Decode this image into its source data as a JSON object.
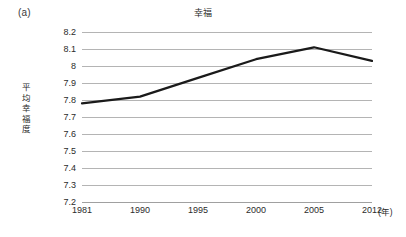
{
  "figure": {
    "panel_label": "(a)",
    "title": "幸福"
  },
  "axes": {
    "y_axis_title": "平均幸福度",
    "x_unit_label": "(年)",
    "y_ticks": [
      "8.2",
      "8.1",
      "8",
      "7.9",
      "7.8",
      "7.7",
      "7.6",
      "7.5",
      "7.4",
      "7.3",
      "7.2"
    ],
    "x_ticks": [
      "1981",
      "1990",
      "1995",
      "2000",
      "2005",
      "2012"
    ]
  },
  "style": {
    "line_color": "#1a1a1a",
    "grid_color": "#b4b4b4",
    "background": "#ffffff"
  },
  "chart_data": {
    "type": "line",
    "title": "幸福",
    "xlabel": "(年)",
    "ylabel": "平均幸福度",
    "categories": [
      "1981",
      "1990",
      "1995",
      "2000",
      "2005",
      "2012"
    ],
    "values": [
      7.78,
      7.82,
      7.93,
      8.04,
      8.11,
      8.03
    ],
    "series": [
      {
        "name": "平均幸福度",
        "values": [
          7.78,
          7.82,
          7.93,
          8.04,
          8.11,
          8.03
        ]
      }
    ],
    "ylim": [
      7.2,
      8.2
    ],
    "ytick_step": 0.1,
    "grid": "horizontal",
    "legend": "none",
    "markers": "none"
  }
}
